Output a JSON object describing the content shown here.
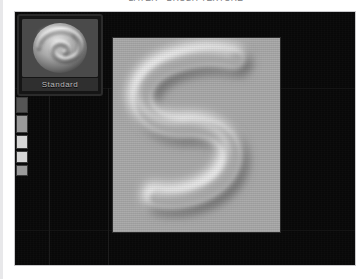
{
  "page": {
    "top_caption": "LAYER - BRUSH TEXTURE",
    "background_color": "#ffffff"
  },
  "app_window": {
    "background_color": "#080808",
    "border_color": "#c9c9cc"
  },
  "preset_panel": {
    "name": "brush-preset",
    "label": "Standard",
    "thumbnail_icon": "swirl-spiral-preview",
    "thumbnail_background": "#4a4a4a",
    "label_bar_color": "#2f2f2f",
    "label_text_color": "#b9b9b9"
  },
  "palette_strip": {
    "name": "tool-palette-strip",
    "chips": [
      {
        "label": "",
        "top": 0,
        "height": 14,
        "tone": "dark"
      },
      {
        "label": "",
        "top": 18,
        "height": 16,
        "tone": "dim"
      },
      {
        "label": "",
        "top": 38,
        "height": 12,
        "tone": "light"
      },
      {
        "label": "",
        "top": 54,
        "height": 10,
        "tone": "light"
      },
      {
        "label": "",
        "top": 68,
        "height": 9,
        "tone": "dim"
      }
    ]
  },
  "canvas": {
    "name": "image-canvas",
    "background_color": "#a8a8a8",
    "stroke_shape": "letter-s-embossed-stroke",
    "highlight_color": "#e6e6e6",
    "shadow_color": "#6b6b6b",
    "stroke_width": 22
  }
}
